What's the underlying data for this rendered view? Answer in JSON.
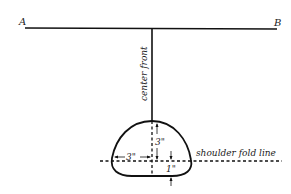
{
  "diagram": {
    "endpoints": {
      "left": "A",
      "right": "B"
    },
    "vertical_label": "center front",
    "fold_label": "shoulder fold line",
    "measurements": {
      "horizontal": "3\"",
      "vertical_up": "3\"",
      "vertical_down": "1\""
    },
    "colors": {
      "stroke": "#111111",
      "background": "#ffffff"
    }
  }
}
